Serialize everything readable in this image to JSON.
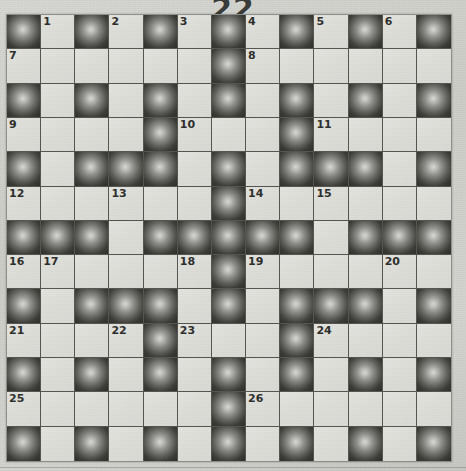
{
  "puzzle": {
    "number_label": "22",
    "columns": 13,
    "rows": 13,
    "block_color": "#3c3d39",
    "cell_color": "#dcdcd7",
    "grid_line_color": "#55564f",
    "paper_color": "#cfd0cb",
    "number_color": "#2f302e",
    "grid": [
      [
        "block",
        "white",
        "block",
        "white",
        "block",
        "white",
        "block",
        "white",
        "block",
        "white",
        "block",
        "white",
        "block"
      ],
      [
        "white",
        "white",
        "white",
        "white",
        "white",
        "white",
        "block",
        "white",
        "white",
        "white",
        "white",
        "white",
        "white"
      ],
      [
        "block",
        "white",
        "block",
        "white",
        "block",
        "white",
        "block",
        "white",
        "block",
        "white",
        "block",
        "white",
        "block"
      ],
      [
        "white",
        "white",
        "white",
        "white",
        "block",
        "white",
        "white",
        "white",
        "block",
        "white",
        "white",
        "white",
        "white"
      ],
      [
        "block",
        "white",
        "block",
        "block",
        "block",
        "white",
        "block",
        "white",
        "block",
        "block",
        "block",
        "white",
        "block"
      ],
      [
        "white",
        "white",
        "white",
        "white",
        "white",
        "white",
        "block",
        "white",
        "white",
        "white",
        "white",
        "white",
        "white"
      ],
      [
        "block",
        "block",
        "block",
        "white",
        "block",
        "block",
        "block",
        "block",
        "block",
        "white",
        "block",
        "block",
        "block"
      ],
      [
        "white",
        "white",
        "white",
        "white",
        "white",
        "white",
        "block",
        "white",
        "white",
        "white",
        "white",
        "white",
        "white"
      ],
      [
        "block",
        "white",
        "block",
        "block",
        "block",
        "white",
        "block",
        "white",
        "block",
        "block",
        "block",
        "white",
        "block"
      ],
      [
        "white",
        "white",
        "white",
        "white",
        "block",
        "white",
        "white",
        "white",
        "block",
        "white",
        "white",
        "white",
        "white"
      ],
      [
        "block",
        "white",
        "block",
        "white",
        "block",
        "white",
        "block",
        "white",
        "block",
        "white",
        "block",
        "white",
        "block"
      ],
      [
        "white",
        "white",
        "white",
        "white",
        "white",
        "white",
        "block",
        "white",
        "white",
        "white",
        "white",
        "white",
        "white"
      ],
      [
        "block",
        "white",
        "block",
        "white",
        "block",
        "white",
        "block",
        "white",
        "block",
        "white",
        "block",
        "white",
        "block"
      ]
    ],
    "numbers": [
      {
        "row": 0,
        "col": 1,
        "label": "1"
      },
      {
        "row": 0,
        "col": 3,
        "label": "2"
      },
      {
        "row": 0,
        "col": 5,
        "label": "3"
      },
      {
        "row": 0,
        "col": 7,
        "label": "4"
      },
      {
        "row": 0,
        "col": 9,
        "label": "5"
      },
      {
        "row": 0,
        "col": 11,
        "label": "6"
      },
      {
        "row": 1,
        "col": 0,
        "label": "7"
      },
      {
        "row": 1,
        "col": 7,
        "label": "8"
      },
      {
        "row": 3,
        "col": 0,
        "label": "9"
      },
      {
        "row": 3,
        "col": 5,
        "label": "10"
      },
      {
        "row": 3,
        "col": 9,
        "label": "11"
      },
      {
        "row": 5,
        "col": 0,
        "label": "12"
      },
      {
        "row": 5,
        "col": 3,
        "label": "13"
      },
      {
        "row": 5,
        "col": 7,
        "label": "14"
      },
      {
        "row": 5,
        "col": 9,
        "label": "15"
      },
      {
        "row": 7,
        "col": 0,
        "label": "16"
      },
      {
        "row": 7,
        "col": 1,
        "label": "17"
      },
      {
        "row": 7,
        "col": 5,
        "label": "18"
      },
      {
        "row": 7,
        "col": 7,
        "label": "19"
      },
      {
        "row": 7,
        "col": 11,
        "label": "20"
      },
      {
        "row": 9,
        "col": 0,
        "label": "21"
      },
      {
        "row": 9,
        "col": 3,
        "label": "22"
      },
      {
        "row": 9,
        "col": 5,
        "label": "23"
      },
      {
        "row": 9,
        "col": 9,
        "label": "24"
      },
      {
        "row": 11,
        "col": 0,
        "label": "25"
      },
      {
        "row": 11,
        "col": 7,
        "label": "26"
      }
    ]
  }
}
